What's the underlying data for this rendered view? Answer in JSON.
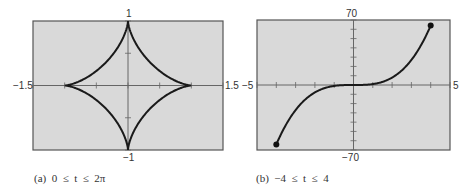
{
  "chart_data": [
    {
      "type": "line",
      "title": "",
      "caption": "(a)  0  ≤  t  ≤  2π",
      "curve": "astroid x=cos^3 t, y=sin^3 t",
      "xlim": [
        -1.5,
        1.5
      ],
      "ylim": [
        -1,
        1
      ],
      "xtick_step": 0.5,
      "ytick_step": 0.5,
      "labels": {
        "xmin": "−1.5",
        "xmax": "1.5",
        "ymin": "−1",
        "ymax": "1"
      },
      "points": [
        [
          1,
          0
        ],
        [
          0.65,
          0.27
        ],
        [
          0.35,
          0.35
        ],
        [
          0.27,
          0.65
        ],
        [
          0,
          1
        ],
        [
          -0.27,
          0.65
        ],
        [
          -0.35,
          0.35
        ],
        [
          -0.65,
          0.27
        ],
        [
          -1,
          0
        ],
        [
          -0.65,
          -0.27
        ],
        [
          -0.35,
          -0.35
        ],
        [
          -0.27,
          -0.65
        ],
        [
          0,
          -1
        ],
        [
          0.27,
          -0.65
        ],
        [
          0.35,
          -0.35
        ],
        [
          0.65,
          -0.27
        ],
        [
          1,
          0
        ]
      ],
      "grid": false,
      "background": "#d9d9d9"
    },
    {
      "type": "line",
      "title": "",
      "caption": "(b)  −4  ≤  t  ≤  4",
      "curve": "x=t, y=t^3",
      "xlim": [
        -5,
        5
      ],
      "ylim": [
        -70,
        70
      ],
      "xtick_step": 1,
      "ytick_step": 10,
      "labels": {
        "xmin": "−5",
        "xmax": "5",
        "ymin": "−70",
        "ymax": "70"
      },
      "points": [
        [
          -4,
          -64
        ],
        [
          -3,
          -27
        ],
        [
          -2,
          -8
        ],
        [
          -1,
          -1
        ],
        [
          0,
          0
        ],
        [
          1,
          1
        ],
        [
          2,
          8
        ],
        [
          3,
          27
        ],
        [
          4,
          64
        ]
      ],
      "endpoints": [
        [
          -4,
          -64
        ],
        [
          4,
          64
        ]
      ],
      "grid": false,
      "background": "#d9d9d9"
    }
  ]
}
